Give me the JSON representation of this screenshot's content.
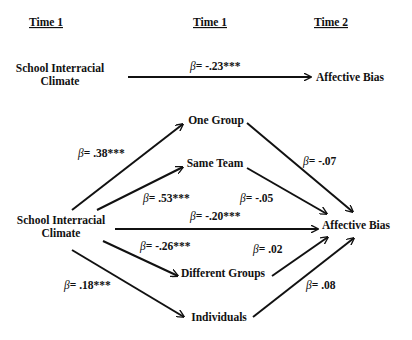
{
  "headers": {
    "col1": "Time 1",
    "col2": "Time 1",
    "col3": "Time 2"
  },
  "top_model": {
    "predictor": {
      "line1": "School Interracial",
      "line2": "Climate"
    },
    "outcome": "Affective Bias",
    "path": {
      "symbol": "β",
      "value": "= -.23***"
    }
  },
  "mediation_model": {
    "predictor": {
      "line1": "School Interracial",
      "line2": "Climate"
    },
    "outcome": "Affective Bias",
    "mediators": [
      {
        "label": "One Group"
      },
      {
        "label": "Same Team"
      },
      {
        "label": "Different Groups"
      },
      {
        "label": "Individuals"
      }
    ],
    "paths": {
      "climate_to_one_group": {
        "symbol": "β",
        "value": "= .38***"
      },
      "climate_to_same_team": {
        "symbol": "β",
        "value": "= .53***"
      },
      "climate_to_bias_direct": {
        "symbol": "β",
        "value": "= -.20***"
      },
      "climate_to_different_groups": {
        "symbol": "β",
        "value": "= -.26***"
      },
      "climate_to_individuals": {
        "symbol": "β",
        "value": "= .18***"
      },
      "one_group_to_bias": {
        "symbol": "β",
        "value": "= -.07"
      },
      "same_team_to_bias": {
        "symbol": "β",
        "value": "= -.05"
      },
      "different_groups_to_bias": {
        "symbol": "β",
        "value": "= .02"
      },
      "individuals_to_bias": {
        "symbol": "β",
        "value": "= .08"
      }
    }
  },
  "colors": {
    "ink": "#111111",
    "background": "#ffffff"
  }
}
